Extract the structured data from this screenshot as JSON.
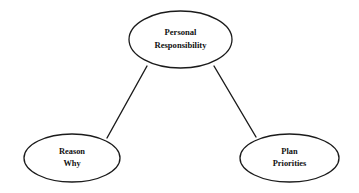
{
  "diagram": {
    "type": "hierarchy-ellipse-diagram",
    "background_color": "#ffffff",
    "stroke_color": "#1b1b1b",
    "text_color": "#111111",
    "nodes": [
      {
        "id": "personal-responsibility",
        "role": "root",
        "line1": "Personal",
        "line2": "Responsibility",
        "cx": 180.5,
        "cy": 39.5,
        "rx": 51.5,
        "ry": 28.5
      },
      {
        "id": "reason-why",
        "role": "child",
        "line1": "Reason",
        "line2": "Why",
        "cx": 72,
        "cy": 158,
        "rx": 48,
        "ry": 24
      },
      {
        "id": "plan-priorities",
        "role": "child",
        "line1": "Plan",
        "line2": "Priorities",
        "cx": 289.5,
        "cy": 158,
        "rx": 49.5,
        "ry": 24
      }
    ],
    "edges": [
      {
        "id": "edge-root-to-reason-why",
        "from": "personal-responsibility",
        "to": "reason-why",
        "x1": 147,
        "y1": 66,
        "x2": 107,
        "y2": 138
      },
      {
        "id": "edge-root-to-plan-priorities",
        "from": "personal-responsibility",
        "to": "plan-priorities",
        "x1": 214,
        "y1": 66,
        "x2": 256,
        "y2": 137
      }
    ]
  }
}
